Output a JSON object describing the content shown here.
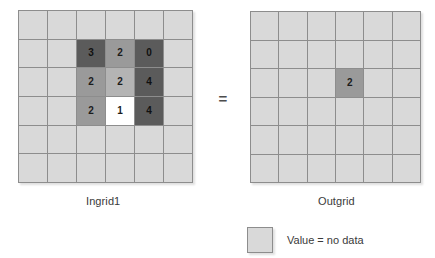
{
  "figure": {
    "operator": "=",
    "legend": {
      "swatch_color": "#d9d9d9",
      "label": "Value = no data"
    },
    "palette": {
      "no_data": "#d9d9d9",
      "white": "#ffffff",
      "light": "#b4b4b4",
      "medium": "#9a9a9a",
      "dark": "#5b5b5b",
      "grid_line": "#8d8d8d"
    }
  },
  "grids": [
    {
      "name": "ingrid1",
      "caption": "Ingrid1",
      "rows": 6,
      "cols": 6,
      "cells": [
        [
          {
            "value": "",
            "shade": "no-data"
          },
          {
            "value": "",
            "shade": "no-data"
          },
          {
            "value": "",
            "shade": "no-data"
          },
          {
            "value": "",
            "shade": "no-data"
          },
          {
            "value": "",
            "shade": "no-data"
          },
          {
            "value": "",
            "shade": "no-data"
          }
        ],
        [
          {
            "value": "",
            "shade": "no-data"
          },
          {
            "value": "",
            "shade": "no-data"
          },
          {
            "value": "3",
            "shade": "dark"
          },
          {
            "value": "2",
            "shade": "medium"
          },
          {
            "value": "0",
            "shade": "dark"
          },
          {
            "value": "",
            "shade": "no-data"
          }
        ],
        [
          {
            "value": "",
            "shade": "no-data"
          },
          {
            "value": "",
            "shade": "no-data"
          },
          {
            "value": "2",
            "shade": "medium"
          },
          {
            "value": "2",
            "shade": "light"
          },
          {
            "value": "4",
            "shade": "dark"
          },
          {
            "value": "",
            "shade": "no-data"
          }
        ],
        [
          {
            "value": "",
            "shade": "no-data"
          },
          {
            "value": "",
            "shade": "no-data"
          },
          {
            "value": "2",
            "shade": "medium"
          },
          {
            "value": "1",
            "shade": "white"
          },
          {
            "value": "4",
            "shade": "dark"
          },
          {
            "value": "",
            "shade": "no-data"
          }
        ],
        [
          {
            "value": "",
            "shade": "no-data"
          },
          {
            "value": "",
            "shade": "no-data"
          },
          {
            "value": "",
            "shade": "no-data"
          },
          {
            "value": "",
            "shade": "no-data"
          },
          {
            "value": "",
            "shade": "no-data"
          },
          {
            "value": "",
            "shade": "no-data"
          }
        ],
        [
          {
            "value": "",
            "shade": "no-data"
          },
          {
            "value": "",
            "shade": "no-data"
          },
          {
            "value": "",
            "shade": "no-data"
          },
          {
            "value": "",
            "shade": "no-data"
          },
          {
            "value": "",
            "shade": "no-data"
          },
          {
            "value": "",
            "shade": "no-data"
          }
        ]
      ]
    },
    {
      "name": "outgrid",
      "caption": "Outgrid",
      "rows": 6,
      "cols": 6,
      "cells": [
        [
          {
            "value": "",
            "shade": "no-data"
          },
          {
            "value": "",
            "shade": "no-data"
          },
          {
            "value": "",
            "shade": "no-data"
          },
          {
            "value": "",
            "shade": "no-data"
          },
          {
            "value": "",
            "shade": "no-data"
          },
          {
            "value": "",
            "shade": "no-data"
          }
        ],
        [
          {
            "value": "",
            "shade": "no-data"
          },
          {
            "value": "",
            "shade": "no-data"
          },
          {
            "value": "",
            "shade": "no-data"
          },
          {
            "value": "",
            "shade": "no-data"
          },
          {
            "value": "",
            "shade": "no-data"
          },
          {
            "value": "",
            "shade": "no-data"
          }
        ],
        [
          {
            "value": "",
            "shade": "no-data"
          },
          {
            "value": "",
            "shade": "no-data"
          },
          {
            "value": "",
            "shade": "no-data"
          },
          {
            "value": "2",
            "shade": "medium"
          },
          {
            "value": "",
            "shade": "no-data"
          },
          {
            "value": "",
            "shade": "no-data"
          }
        ],
        [
          {
            "value": "",
            "shade": "no-data"
          },
          {
            "value": "",
            "shade": "no-data"
          },
          {
            "value": "",
            "shade": "no-data"
          },
          {
            "value": "",
            "shade": "no-data"
          },
          {
            "value": "",
            "shade": "no-data"
          },
          {
            "value": "",
            "shade": "no-data"
          }
        ],
        [
          {
            "value": "",
            "shade": "no-data"
          },
          {
            "value": "",
            "shade": "no-data"
          },
          {
            "value": "",
            "shade": "no-data"
          },
          {
            "value": "",
            "shade": "no-data"
          },
          {
            "value": "",
            "shade": "no-data"
          },
          {
            "value": "",
            "shade": "no-data"
          }
        ],
        [
          {
            "value": "",
            "shade": "no-data"
          },
          {
            "value": "",
            "shade": "no-data"
          },
          {
            "value": "",
            "shade": "no-data"
          },
          {
            "value": "",
            "shade": "no-data"
          },
          {
            "value": "",
            "shade": "no-data"
          },
          {
            "value": "",
            "shade": "no-data"
          }
        ]
      ]
    }
  ]
}
